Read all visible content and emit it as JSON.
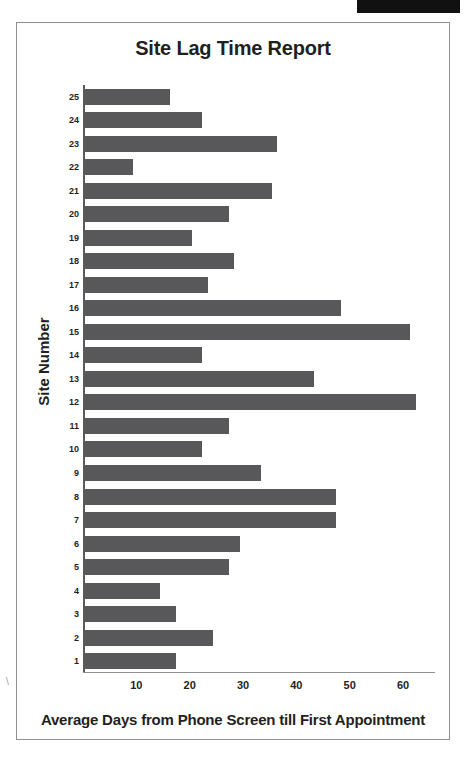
{
  "page": {
    "redaction_present": true
  },
  "chart_data": {
    "type": "bar",
    "orientation": "horizontal",
    "title": "Site Lag Time Report",
    "xlabel": "Average Days from Phone Screen till First Appointment",
    "ylabel": "Site Number",
    "categories": [
      "1",
      "2",
      "3",
      "4",
      "5",
      "6",
      "7",
      "8",
      "9",
      "10",
      "11",
      "12",
      "13",
      "14",
      "15",
      "16",
      "17",
      "18",
      "19",
      "20",
      "21",
      "22",
      "23",
      "24",
      "25"
    ],
    "values": [
      17,
      24,
      17,
      14,
      27,
      29,
      47,
      47,
      33,
      22,
      27,
      62,
      43,
      22,
      61,
      48,
      23,
      28,
      20,
      27,
      35,
      9,
      36,
      22,
      16
    ],
    "xlim": [
      0,
      66
    ],
    "xticks": [
      10,
      20,
      30,
      40,
      50,
      60
    ],
    "xticklabels": [
      "10",
      "20",
      "30",
      "40",
      "50",
      "60"
    ],
    "grid": false,
    "legend": false,
    "bar_color": "#58585a",
    "axis_color": "#5a5a5a",
    "text_color": "#231f20"
  }
}
